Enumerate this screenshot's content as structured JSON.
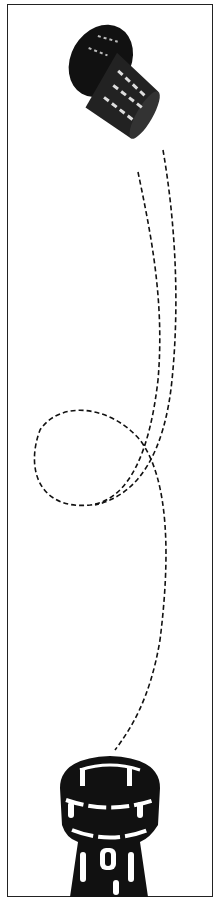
{
  "illustration": {
    "subject": "cork popping from bottle",
    "elements": [
      "cork",
      "dashed-trajectory",
      "bottle-neck"
    ],
    "colors": {
      "ink": "#111111",
      "background": "#ffffff",
      "border": "#222222"
    }
  }
}
